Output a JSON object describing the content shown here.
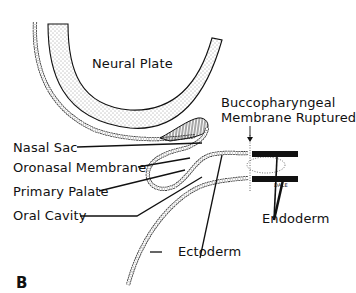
{
  "figure": {
    "panel_letter": "B",
    "signature": "DALE"
  },
  "labels": {
    "neural_plate": "Neural Plate",
    "buccopharyngeal_line1": "Buccopharyngeal",
    "buccopharyngeal_line2": "Membrane Ruptured",
    "nasal_sac": "Nasal Sac",
    "oronasal_membrane": "Oronasal Membrane",
    "primary_palate": "Primary Palate",
    "oral_cavity": "Oral Cavity",
    "ectoderm": "Ectoderm",
    "endoderm": "Endoderm"
  },
  "colors": {
    "ink": "#111111",
    "background": "#ffffff"
  }
}
